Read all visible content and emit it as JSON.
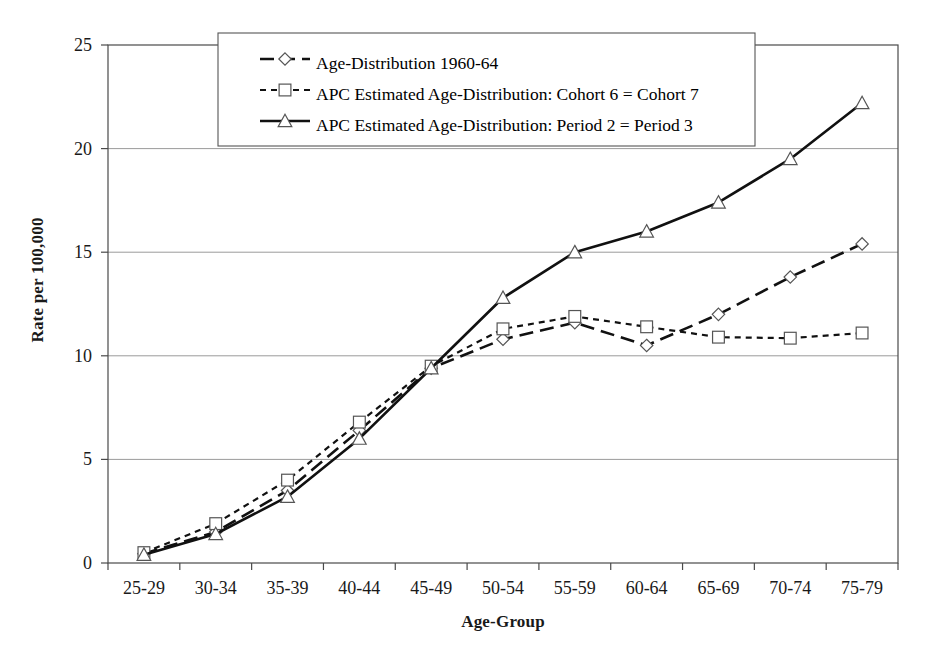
{
  "chart_data": {
    "type": "line",
    "title": "",
    "xlabel": "Age-Group",
    "ylabel": "Rate per 100,000",
    "categories": [
      "25-29",
      "30-34",
      "35-39",
      "40-44",
      "45-49",
      "50-54",
      "55-59",
      "60-64",
      "65-69",
      "70-74",
      "75-79"
    ],
    "ylim": [
      0,
      25
    ],
    "yticks": [
      0,
      5,
      10,
      15,
      20,
      25
    ],
    "ytick_labels": [
      "0",
      "5",
      "10",
      "15",
      "20",
      "25"
    ],
    "grid": "horizontal",
    "legend_position": "top-center",
    "series": [
      {
        "name": "Age-Distribution 1960-64",
        "marker": "diamond",
        "linestyle": "long-dash",
        "values": [
          0.45,
          1.5,
          3.5,
          6.4,
          9.4,
          10.8,
          11.6,
          10.5,
          12.0,
          13.8,
          15.4
        ]
      },
      {
        "name": "APC Estimated Age-Distribution: Cohort 6 = Cohort 7",
        "marker": "square",
        "linestyle": "short-dash",
        "values": [
          0.5,
          1.9,
          4.0,
          6.8,
          9.5,
          11.3,
          11.9,
          11.4,
          10.9,
          10.85,
          11.1
        ]
      },
      {
        "name": "APC Estimated Age-Distribution: Period 2 = Period 3",
        "marker": "triangle",
        "linestyle": "solid",
        "values": [
          0.4,
          1.4,
          3.2,
          6.0,
          9.4,
          12.8,
          15.0,
          16.0,
          17.4,
          19.5,
          22.2
        ]
      }
    ]
  },
  "legend": {
    "entries": [
      "Age-Distribution 1960-64",
      "APC Estimated Age-Distribution: Cohort 6 = Cohort 7",
      "APC Estimated Age-Distribution: Period 2 = Period 3"
    ]
  }
}
